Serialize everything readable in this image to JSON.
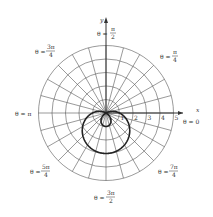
{
  "chart_data": {
    "type": "polar",
    "title": "",
    "curve": "r = 1 - 2 sin θ",
    "axes": {
      "x_label": "x",
      "y_label": "y"
    },
    "radial_ticks": [
      "1",
      "2",
      "3",
      "4",
      "5"
    ],
    "radial_range": [
      0,
      5
    ],
    "angular_grid_step_deg": 15,
    "angle_labels": [
      {
        "angle": "θ = 0",
        "pos": "right"
      },
      {
        "angle": "θ = π/4",
        "pos": "top-right"
      },
      {
        "angle": "θ = π/2",
        "pos": "top"
      },
      {
        "angle": "θ = 3π/4",
        "pos": "top-left"
      },
      {
        "angle": "θ = π",
        "pos": "left"
      },
      {
        "angle": "θ = 5π/4",
        "pos": "bottom-left"
      },
      {
        "angle": "θ = 3π/2",
        "pos": "bottom"
      },
      {
        "angle": "θ = 7π/4",
        "pos": "bottom-right"
      }
    ],
    "grid": true
  },
  "labels": {
    "x": "x",
    "y": "y",
    "t0": "θ = 0",
    "t_pi": "θ = π",
    "prefix": "θ =",
    "pi": "π",
    "pi4": "π",
    "d4": "4",
    "d2": "2",
    "n3pi": "3π",
    "n5pi": "5π",
    "n7pi": "7π"
  }
}
